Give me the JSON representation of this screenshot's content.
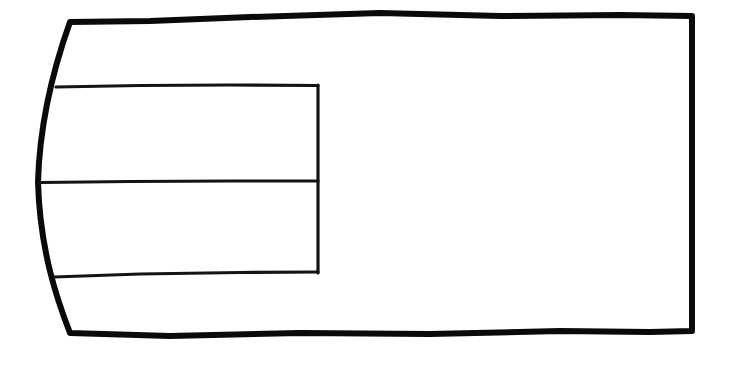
{
  "diagram": {
    "title": "",
    "kind": "line-drawing",
    "style": "hand-drawn",
    "background_color": "#ffffff",
    "stroke_color": "#0a0a0a",
    "inner_stroke_color": "#141414",
    "canvas": {
      "width": 730,
      "height": 369
    },
    "outer_shape": {
      "name": "outer-panel",
      "description": "Large quadrilateral panel with a left edge that bulges outward to the left; top and bottom edges are slightly wavy, right edge is straight and vertical.",
      "stroke_width": 6,
      "fill": "none",
      "path": "M 70 22 C 60 50, 40 110, 38 182 C 40 252, 58 302, 70 333 L 170 336 L 300 333 L 430 334 L 560 331 L 650 332 L 692 331 L 692 16 L 620 15 L 500 16 L 380 13 L 250 17 L 150 21 Z",
      "corner_labels": {
        "top_left": "70,22",
        "top_right": "692,16",
        "bottom_right": "692,331",
        "bottom_left": "70,333",
        "left_bulge_apex": "38,182"
      }
    },
    "inner_shape": {
      "name": "inner-table",
      "description": "Rectangle occupying the left portion of the panel, split by one horizontal divider into an upper and a lower cell. Its left side is the curved left edge of the outer panel.",
      "stroke_width": 3.2,
      "fill": "none",
      "right_edge_x": 318,
      "top_edge_y": 86,
      "divider_y": 181,
      "bottom_edge_y": 275,
      "top_path": "M 56 87 L 140 85.5 L 230 85 L 318 85.5",
      "divider_path": "M 40 182.5 L 130 181.5 L 230 181 L 318 181",
      "bottom_path": "M 54 277 L 140 274 L 240 272.5 L 318 272",
      "right_path": "M 318 85 L 318 181 L 318 273",
      "cells": [
        {
          "name": "upper-cell",
          "row": 1,
          "label": ""
        },
        {
          "name": "lower-cell",
          "row": 2,
          "label": ""
        }
      ]
    },
    "regions": [
      {
        "name": "inner-upper-cell",
        "label": ""
      },
      {
        "name": "inner-lower-cell",
        "label": ""
      },
      {
        "name": "outer-right-area",
        "label": ""
      },
      {
        "name": "outer-top-strip",
        "label": ""
      },
      {
        "name": "outer-bottom-strip",
        "label": ""
      }
    ],
    "annotations": [],
    "labels": [],
    "text_content": []
  }
}
